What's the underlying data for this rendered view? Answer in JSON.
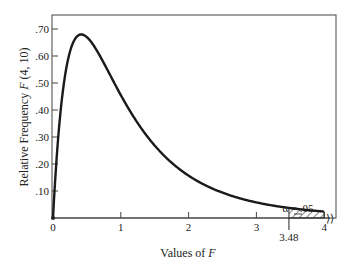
{
  "chart_data": {
    "type": "line",
    "title": "",
    "xlabel": "Values of F",
    "ylabel": "Relative Frequency F (4, 10)",
    "xlim": [
      0,
      4
    ],
    "ylim": [
      0,
      0.75
    ],
    "x_ticks": [
      "0",
      "1",
      "2",
      "3",
      "4"
    ],
    "y_ticks": [
      ".10",
      ".20",
      ".30",
      ".40",
      ".50",
      ".60",
      ".70"
    ],
    "series": [
      {
        "name": "F(4, 10) density",
        "x": [
          0,
          0.1,
          0.2,
          0.3,
          0.4,
          0.5,
          0.75,
          1.0,
          1.25,
          1.5,
          2.0,
          2.5,
          3.0,
          3.48,
          4.0
        ],
        "values": [
          0,
          0.43,
          0.59,
          0.65,
          0.67,
          0.66,
          0.58,
          0.48,
          0.38,
          0.3,
          0.19,
          0.12,
          0.075,
          0.05,
          0.032
        ]
      }
    ],
    "annotations": [
      {
        "text": "α = .05",
        "target": "shaded tail area right of 3.48"
      },
      {
        "text": "3.48",
        "target": "critical value marker on x-axis"
      }
    ],
    "shaded_region": {
      "from": 3.48,
      "to": 4.0,
      "style": "hatched"
    },
    "grid": false,
    "legend": "none"
  },
  "labels": {
    "xlabel_prefix": "Values of ",
    "xlabel_var": "F",
    "ylabel_text": "Relative Frequency ",
    "ylabel_var": "F",
    "ylabel_suffix": " (4, 10)",
    "alpha": "α = .05",
    "critical": "3.48"
  }
}
